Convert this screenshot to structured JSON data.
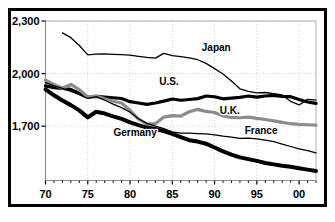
{
  "chart_data": {
    "type": "line",
    "title": "",
    "subtitle": "",
    "xlabel": "",
    "ylabel": "",
    "xlim": [
      1970,
      2002
    ],
    "ylim": [
      1390,
      2300
    ],
    "xticks": [
      1970,
      1975,
      1980,
      1985,
      1990,
      1995,
      2000
    ],
    "xtick_labels": [
      "70",
      "75",
      "80",
      "85",
      "90",
      "95",
      "00"
    ],
    "yticks": [
      1700,
      2000,
      2300
    ],
    "ytick_labels": [
      "1,700",
      "2,000",
      "2,300"
    ],
    "grid": "dotted-both",
    "legend": "inline-annotations",
    "series": [
      {
        "name": "Japan",
        "color": "#000000",
        "width": 1.3,
        "label_x": 1990.2,
        "label_y": 2130,
        "x": [
          1972,
          1973,
          1974,
          1975,
          1976,
          1977,
          1978,
          1979,
          1980,
          1981,
          1982,
          1983,
          1984,
          1985,
          1986,
          1987,
          1988,
          1989,
          1990,
          1991,
          1992,
          1993,
          1994,
          1995,
          1996,
          1997,
          1998,
          1999,
          2000,
          2001,
          2002
        ],
        "y": [
          2232,
          2205,
          2160,
          2107,
          2111,
          2112,
          2110,
          2108,
          2105,
          2098,
          2092,
          2088,
          2115,
          2102,
          2097,
          2090,
          2079,
          2058,
          2028,
          1998,
          1958,
          1913,
          1898,
          1890,
          1892,
          1885,
          1878,
          1842,
          1821,
          1853,
          1848
        ]
      },
      {
        "name": "U.S.",
        "color": "#000000",
        "width": 3.2,
        "label_x": 1984.6,
        "label_y": 1935,
        "x": [
          1970,
          1971,
          1972,
          1973,
          1974,
          1975,
          1976,
          1977,
          1978,
          1979,
          1980,
          1981,
          1982,
          1983,
          1984,
          1985,
          1986,
          1987,
          1988,
          1989,
          1990,
          1991,
          1992,
          1993,
          1994,
          1995,
          1996,
          1997,
          1998,
          1999,
          2000,
          2001,
          2002
        ],
        "y": [
          1930,
          1920,
          1916,
          1910,
          1887,
          1865,
          1870,
          1866,
          1862,
          1858,
          1840,
          1832,
          1824,
          1832,
          1843,
          1855,
          1848,
          1852,
          1857,
          1872,
          1868,
          1856,
          1860,
          1864,
          1872,
          1866,
          1872,
          1876,
          1870,
          1868,
          1852,
          1838,
          1830
        ]
      },
      {
        "name": "U.K.",
        "color": "#8c8c8c",
        "width": 3.2,
        "label_x": 1991.8,
        "label_y": 1770,
        "x": [
          1970,
          1971,
          1972,
          1973,
          1974,
          1975,
          1976,
          1977,
          1978,
          1979,
          1980,
          1981,
          1982,
          1983,
          1984,
          1985,
          1986,
          1987,
          1988,
          1989,
          1990,
          1991,
          1992,
          1993,
          1994,
          1995,
          1996,
          1997,
          1998,
          1999,
          2000,
          2001,
          2002
        ],
        "y": [
          1962,
          1938,
          1916,
          1938,
          1908,
          1866,
          1872,
          1856,
          1842,
          1832,
          1790,
          1740,
          1712,
          1714,
          1752,
          1760,
          1757,
          1782,
          1796,
          1784,
          1778,
          1758,
          1750,
          1748,
          1752,
          1744,
          1738,
          1730,
          1722,
          1714,
          1710,
          1708,
          1706
        ]
      },
      {
        "name": "France",
        "color": "#000000",
        "width": 1.3,
        "label_x": 1995.5,
        "label_y": 1655,
        "x": [
          1970,
          1971,
          1972,
          1973,
          1974,
          1975,
          1976,
          1977,
          1978,
          1979,
          1980,
          1981,
          1982,
          1983,
          1984,
          1985,
          1986,
          1987,
          1988,
          1989,
          1990,
          1991,
          1992,
          1993,
          1994,
          1995,
          1996,
          1997,
          1998,
          1999,
          2000,
          2001,
          2002
        ],
        "y": [
          1948,
          1930,
          1915,
          1898,
          1880,
          1858,
          1868,
          1848,
          1826,
          1806,
          1780,
          1742,
          1716,
          1700,
          1686,
          1668,
          1660,
          1660,
          1658,
          1656,
          1650,
          1643,
          1638,
          1630,
          1632,
          1628,
          1620,
          1612,
          1598,
          1584,
          1570,
          1560,
          1548
        ]
      },
      {
        "name": "Germany",
        "color": "#000000",
        "width": 4.0,
        "label_x": 1980.6,
        "label_y": 1642,
        "x": [
          1970,
          1971,
          1972,
          1973,
          1974,
          1975,
          1976,
          1977,
          1978,
          1979,
          1980,
          1981,
          1982,
          1983,
          1984,
          1985,
          1986,
          1987,
          1988,
          1989,
          1990,
          1991,
          1992,
          1993,
          1994,
          1995,
          1996,
          1997,
          1998,
          1999,
          2000,
          2001,
          2002
        ],
        "y": [
          1910,
          1876,
          1846,
          1820,
          1790,
          1750,
          1782,
          1772,
          1756,
          1742,
          1722,
          1706,
          1692,
          1684,
          1672,
          1656,
          1638,
          1620,
          1612,
          1600,
          1578,
          1556,
          1538,
          1522,
          1512,
          1502,
          1490,
          1482,
          1474,
          1468,
          1460,
          1452,
          1444
        ]
      }
    ]
  }
}
